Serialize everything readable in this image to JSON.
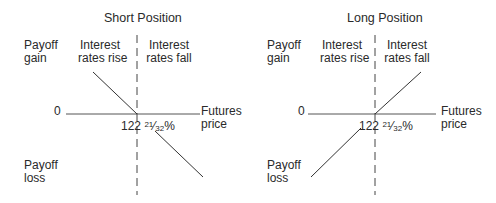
{
  "diagrams": [
    {
      "title": "Short Position",
      "y_top_label": "Payoff gain",
      "y_top_label_lines": [
        "Payoff",
        "gain"
      ],
      "y_bottom_label_lines": [
        "Payoff",
        "loss"
      ],
      "left_region_lines": [
        "Interest",
        "rates rise"
      ],
      "right_region_lines": [
        "Interest",
        "rates fall"
      ],
      "zero_label": "0",
      "x_axis_label_lines": [
        "Futures",
        "price"
      ],
      "strike_whole": "122",
      "strike_num": "21",
      "strike_den": "32",
      "strike_pct": "%",
      "payoff_direction": "downward sloping"
    },
    {
      "title": "Long Position",
      "y_top_label_lines": [
        "Payoff",
        "gain"
      ],
      "y_bottom_label_lines": [
        "Payoff",
        "loss"
      ],
      "left_region_lines": [
        "Interest",
        "rates rise"
      ],
      "right_region_lines": [
        "Interest",
        "rates fall"
      ],
      "zero_label": "0",
      "x_axis_label_lines": [
        "Futures",
        "price"
      ],
      "strike_whole": "122",
      "strike_num": "21",
      "strike_den": "32",
      "strike_pct": "%",
      "payoff_direction": "upward sloping"
    }
  ],
  "colors": {
    "line": "#3a3a3a",
    "text": "#2a2a2a",
    "background": "#ffffff"
  }
}
